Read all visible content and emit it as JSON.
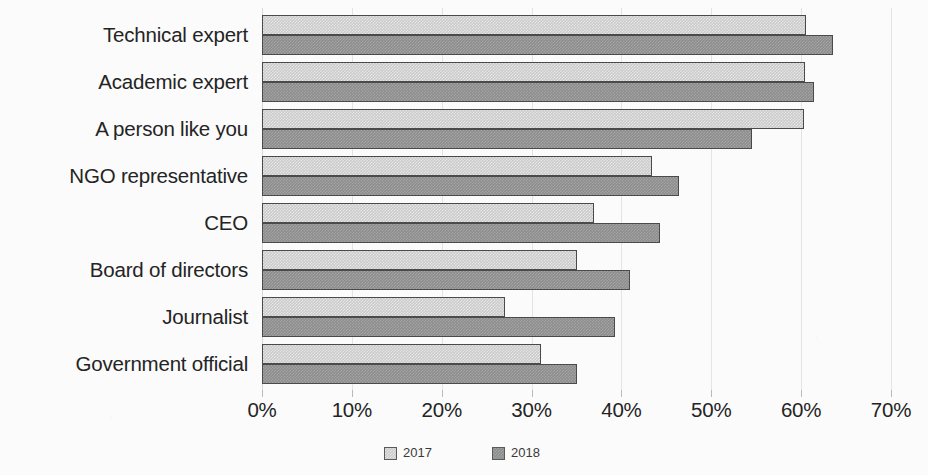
{
  "chart_data": {
    "type": "bar",
    "orientation": "horizontal",
    "title": "",
    "xlabel": "",
    "ylabel": "",
    "categories": [
      "Technical expert",
      "Academic expert",
      "A person like you",
      "NGO representative",
      "CEO",
      "Board of directors",
      "Journalist",
      "Government official"
    ],
    "series": [
      {
        "name": "2017",
        "color": "#cacaca",
        "values": [
          60.5,
          60.4,
          60.3,
          43.4,
          37.0,
          35.1,
          27.0,
          31.1
        ]
      },
      {
        "name": "2018",
        "color": "#8d8d8d",
        "values": [
          63.6,
          61.4,
          54.5,
          46.4,
          44.3,
          41.0,
          39.3,
          35.0
        ]
      }
    ],
    "xlim": [
      0,
      70
    ],
    "xticks": [
      0,
      10,
      20,
      30,
      40,
      50,
      60,
      70
    ],
    "xtick_labels": [
      "0%",
      "10%",
      "20%",
      "30%",
      "40%",
      "50%",
      "60%",
      "70%"
    ],
    "grid": true,
    "legend_position": "bottom-center",
    "value_suffix": "%"
  },
  "legend": {
    "items": [
      {
        "label": "2017",
        "swatch": "legend-swatch-2017"
      },
      {
        "label": "2018",
        "swatch": "legend-swatch-2018"
      }
    ]
  }
}
